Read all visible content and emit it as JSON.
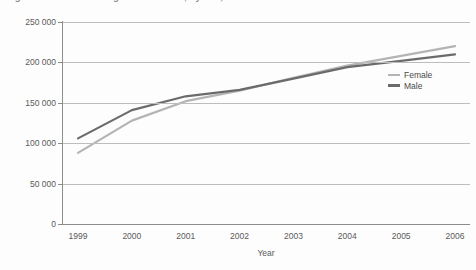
{
  "title": {
    "text": "Figure 1  Students in higher education, by sex, 1999 to 2006",
    "note": "cropped-at-top"
  },
  "legend": {
    "position": "inside-right",
    "entries": [
      {
        "label": "Female",
        "color": "#b4b4b4"
      },
      {
        "label": "Male",
        "color": "#6b6b6b"
      }
    ]
  },
  "axes": {
    "y_ticks": [
      "0",
      "50 000",
      "100 000",
      "150 000",
      "200 000",
      "250 000"
    ],
    "x_ticks": [
      "1999",
      "2000",
      "2001",
      "2002",
      "2003",
      "2004",
      "2005",
      "2006"
    ],
    "x_title": "Year",
    "y_title": ""
  },
  "chart_data": {
    "type": "line",
    "title": "Figure 1  Students in higher education, by sex, 1999 to 2006",
    "xlabel": "Year",
    "ylabel": "",
    "categories": [
      "1999",
      "2000",
      "2001",
      "2002",
      "2003",
      "2004",
      "2005",
      "2006"
    ],
    "x": [
      1999,
      2000,
      2001,
      2002,
      2003,
      2004,
      2005,
      2006
    ],
    "series": [
      {
        "name": "Female",
        "color": "#b4b4b4",
        "values": [
          88000,
          128000,
          152000,
          165000,
          181000,
          196000,
          208000,
          220000
        ]
      },
      {
        "name": "Male",
        "color": "#6b6b6b",
        "values": [
          106000,
          141000,
          158000,
          166000,
          180000,
          194000,
          202000,
          210000
        ]
      }
    ],
    "ylim": [
      0,
      250000
    ],
    "ytick_step": 50000,
    "grid": true,
    "legend_position": "inside-right"
  }
}
